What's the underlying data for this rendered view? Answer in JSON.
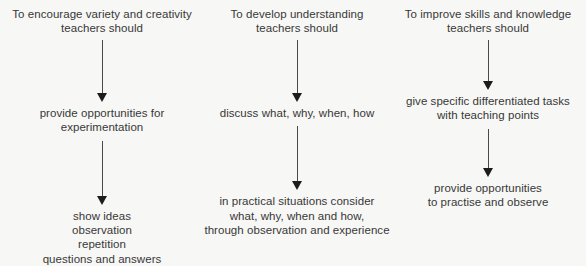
{
  "diagram": {
    "type": "flowchart",
    "orientation": "top-to-bottom",
    "background_color": "#f7f7f5",
    "text_color": "#383838",
    "arrow_color": "#1c1c1c",
    "columns": [
      {
        "id": "encourage-variety-creativity",
        "header": "To encourage variety and creativity\nteachers should",
        "middle": "provide opportunities for experimentation",
        "bottom": "show ideas\nobservation\nrepetition\nquestions and answers"
      },
      {
        "id": "develop-understanding",
        "header": "To develop understanding\nteachers should",
        "middle": "discuss what, why, when, how",
        "bottom": "in practical situations consider\nwhat, why, when and how,\nthrough observation and experience"
      },
      {
        "id": "improve-skills-knowledge",
        "header": "To improve skills and knowledge\nteachers should",
        "middle": "give specific differentiated tasks\nwith teaching points",
        "bottom": "provide opportunities\nto practise and observe"
      }
    ]
  }
}
